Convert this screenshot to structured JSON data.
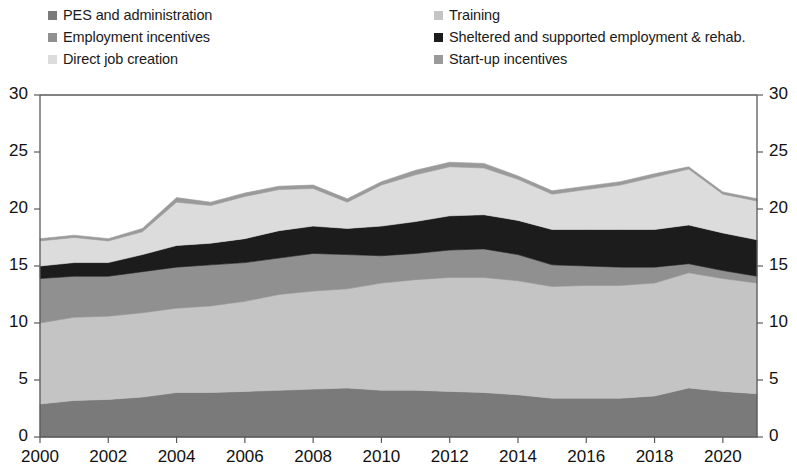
{
  "legend": {
    "columns": [
      {
        "items": [
          {
            "label": "PES and administration",
            "color": "#7a7a7a",
            "key": "pes"
          },
          {
            "label": "Employment incentives",
            "color": "#909090",
            "key": "employment_incentives"
          },
          {
            "label": "Direct job creation",
            "color": "#dcdcdc",
            "key": "direct_job_creation"
          }
        ]
      },
      {
        "items": [
          {
            "label": "Training",
            "color": "#c4c4c4",
            "key": "training"
          },
          {
            "label": "Sheltered and supported employment & rehab.",
            "color": "#1c1c1c",
            "key": "sheltered"
          },
          {
            "label": "Start-up incentives",
            "color": "#9a9a9a",
            "key": "startup"
          }
        ]
      }
    ]
  },
  "chart_data": {
    "type": "area",
    "stacked": true,
    "title": "",
    "xlabel": "",
    "ylabel": "",
    "ylim": [
      0,
      30
    ],
    "yticks": [
      0,
      5,
      10,
      15,
      20,
      25,
      30
    ],
    "ytick_labels_left": [
      "0",
      "5",
      "10",
      "15",
      "20",
      "25",
      "30"
    ],
    "ytick_labels_right": [
      "0",
      "5",
      "10",
      "15",
      "20",
      "25",
      "30"
    ],
    "xlim": [
      2000,
      2021
    ],
    "xticks": [
      2000,
      2002,
      2004,
      2006,
      2008,
      2010,
      2012,
      2014,
      2016,
      2018,
      2020
    ],
    "xtick_labels": [
      "2000",
      "2002",
      "2004",
      "2006",
      "2008",
      "2010",
      "2012",
      "2014",
      "2016",
      "2018",
      "2020"
    ],
    "grid": false,
    "legend_position": "top",
    "x": [
      2000,
      2001,
      2002,
      2003,
      2004,
      2005,
      2006,
      2007,
      2008,
      2009,
      2010,
      2011,
      2012,
      2013,
      2014,
      2015,
      2016,
      2017,
      2018,
      2019,
      2020,
      2021
    ],
    "series": [
      {
        "name": "PES and administration",
        "color": "#7a7a7a",
        "values": [
          2.9,
          3.2,
          3.3,
          3.5,
          3.9,
          3.9,
          4.0,
          4.1,
          4.2,
          4.3,
          4.1,
          4.1,
          4.0,
          3.9,
          3.7,
          3.4,
          3.4,
          3.4,
          3.6,
          4.3,
          4.0,
          3.8
        ]
      },
      {
        "name": "Training",
        "color": "#c4c4c4",
        "values": [
          7.1,
          7.3,
          7.3,
          7.4,
          7.4,
          7.6,
          7.9,
          8.4,
          8.6,
          8.7,
          9.4,
          9.7,
          10.0,
          10.1,
          10.0,
          9.8,
          9.9,
          9.9,
          9.9,
          10.1,
          9.9,
          9.7
        ]
      },
      {
        "name": "Employment incentives",
        "color": "#909090",
        "values": [
          3.9,
          3.6,
          3.5,
          3.6,
          3.6,
          3.6,
          3.4,
          3.2,
          3.3,
          3.0,
          2.4,
          2.3,
          2.4,
          2.5,
          2.3,
          1.9,
          1.7,
          1.6,
          1.4,
          0.8,
          0.7,
          0.6
        ]
      },
      {
        "name": "Sheltered and supported employment & rehab.",
        "color": "#1c1c1c",
        "values": [
          1.1,
          1.2,
          1.2,
          1.5,
          1.9,
          1.9,
          2.1,
          2.4,
          2.4,
          2.3,
          2.6,
          2.8,
          3.0,
          3.0,
          3.0,
          3.1,
          3.2,
          3.3,
          3.3,
          3.4,
          3.3,
          3.2
        ]
      },
      {
        "name": "Direct job creation",
        "color": "#dcdcdc",
        "values": [
          2.2,
          2.2,
          1.9,
          2.0,
          3.8,
          3.3,
          3.7,
          3.6,
          3.3,
          2.3,
          3.6,
          4.1,
          4.3,
          4.1,
          3.6,
          3.1,
          3.5,
          3.9,
          4.6,
          4.9,
          3.4,
          3.4
        ]
      },
      {
        "name": "Start-up incentives",
        "color": "#9a9a9a",
        "values": [
          0.2,
          0.2,
          0.2,
          0.3,
          0.4,
          0.3,
          0.3,
          0.3,
          0.3,
          0.3,
          0.3,
          0.4,
          0.4,
          0.4,
          0.3,
          0.3,
          0.3,
          0.3,
          0.3,
          0.2,
          0.2,
          0.2
        ]
      }
    ],
    "totals": [
      17.4,
      17.7,
      17.4,
      18.3,
      21.0,
      20.6,
      21.4,
      22.0,
      22.1,
      20.9,
      22.4,
      23.4,
      24.1,
      24.0,
      22.9,
      21.6,
      22.0,
      22.4,
      23.1,
      23.7,
      21.5,
      20.9
    ]
  },
  "plot": {
    "left": 40,
    "right": 757,
    "top": 17,
    "bottom": 359
  }
}
